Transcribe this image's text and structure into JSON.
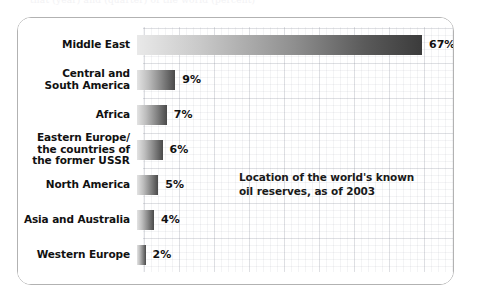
{
  "top_sliver_text": "that  (year)  and  (quarter)  of  the  world  (percent)",
  "chart_data": {
    "type": "bar",
    "orientation": "horizontal",
    "title": "",
    "subtitle": "",
    "annotation": "Location of the world's known\noil reserves, as of 2003",
    "annotation_line1": "Location of the world's known",
    "annotation_line2": "oil reserves, as of 2003",
    "xlabel": "",
    "ylabel": "",
    "xlim": [
      0,
      70
    ],
    "grid": true,
    "legend": "none",
    "unit": "%",
    "categories": [
      "Middle East",
      "Central and\nSouth America",
      "Africa",
      "Eastern Europe/\nthe countries of\nthe former USSR",
      "North America",
      "Asia and Australia",
      "Western Europe"
    ],
    "values": [
      67,
      9,
      7,
      6,
      5,
      4,
      2
    ],
    "value_labels": [
      "67%",
      "9%",
      "7%",
      "6%",
      "5%",
      "4%",
      "2%"
    ],
    "bar_gradient": {
      "from": "#e9e9e9",
      "to": "#3b3b3b",
      "direction": "left-to-right"
    },
    "colors": {
      "text": "#111111",
      "panel_border": "#b2b2b2",
      "panel_background": "#ffffff",
      "page_background": "#ffffff",
      "grid_line": "#6e7382"
    }
  },
  "rows": [
    {
      "label": "Middle East",
      "value_label": "67%",
      "value": 67
    },
    {
      "label": "Central and\nSouth America",
      "value_label": "9%",
      "value": 9
    },
    {
      "label": "Africa",
      "value_label": "7%",
      "value": 7
    },
    {
      "label": "Eastern Europe/\nthe countries of\nthe former USSR",
      "value_label": "6%",
      "value": 6
    },
    {
      "label": "North America",
      "value_label": "5%",
      "value": 5
    },
    {
      "label": "Asia and Australia",
      "value_label": "4%",
      "value": 4
    },
    {
      "label": "Western Europe",
      "value_label": "2%",
      "value": 2
    }
  ]
}
